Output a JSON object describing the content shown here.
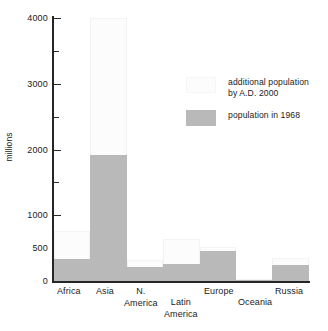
{
  "chart_data": {
    "type": "bar",
    "title": "",
    "subtitle": "",
    "xlabel": "",
    "ylabel": "millions",
    "ylim": [
      0,
      4050
    ],
    "grid": false,
    "stacked": true,
    "legend_position": "upper right",
    "categories": [
      "Africa",
      "Asia",
      "N. America",
      "Latin America",
      "Europe",
      "Oceania",
      "Russia"
    ],
    "category_lines": [
      [
        "Africa"
      ],
      [
        "Asia"
      ],
      [
        "N.",
        "America"
      ],
      [
        "Latin",
        "America"
      ],
      [
        "Europe"
      ],
      [
        "Oceania"
      ],
      [
        "Russia"
      ]
    ],
    "ytick_values": [
      0,
      500,
      1000,
      1500,
      2000,
      2500,
      3000,
      3500,
      4000
    ],
    "ytick_labels": [
      "0",
      "500",
      "1000",
      "",
      "2000",
      "",
      "3000",
      "",
      "4000"
    ],
    "ymajor_ticks": [
      0,
      500,
      1000,
      2000,
      3000,
      4000
    ],
    "yminor_ticks": [
      1500,
      2500,
      3500
    ],
    "series": [
      {
        "name": "population in 1968",
        "color": "#b9b9b9",
        "values": [
          330,
          1920,
          220,
          260,
          450,
          18,
          238
        ]
      },
      {
        "name": "additional population by A.D. 2000",
        "color": "#fcfcfc",
        "values": [
          430,
          2080,
          100,
          380,
          70,
          17,
          114
        ]
      }
    ],
    "totals": [
      760,
      4000,
      320,
      640,
      520,
      35,
      352
    ]
  },
  "axis": {
    "y_label": "millions",
    "y_tick_labels": [
      "4000",
      "3000",
      "2000",
      "1000",
      "500",
      "0"
    ]
  },
  "legend": {
    "items": [
      {
        "swatch": "additional-swatch",
        "lines": [
          "additional population",
          "by A.D. 2000"
        ]
      },
      {
        "swatch": "base-swatch",
        "lines": [
          "population in 1968"
        ]
      }
    ]
  }
}
